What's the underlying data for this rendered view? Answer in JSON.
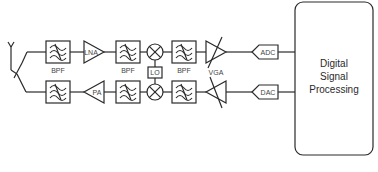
{
  "diagram": {
    "type": "rf-transceiver-block-diagram",
    "rx_chain": {
      "blocks": [
        {
          "id": "bpf1",
          "label": "BPF",
          "kind": "bandpass-filter"
        },
        {
          "id": "lna",
          "label": "LNA",
          "kind": "amplifier"
        },
        {
          "id": "bpf2",
          "label": "BPF",
          "kind": "bandpass-filter"
        },
        {
          "id": "mixer_rx",
          "label": "",
          "kind": "mixer"
        },
        {
          "id": "bpf3",
          "label": "BPF",
          "kind": "bandpass-filter"
        },
        {
          "id": "vga",
          "label": "VGA",
          "kind": "variable-gain-amplifier"
        },
        {
          "id": "adc",
          "label": "ADC",
          "kind": "converter"
        }
      ]
    },
    "tx_chain": {
      "blocks": [
        {
          "id": "bpf4",
          "label": "",
          "kind": "bandpass-filter"
        },
        {
          "id": "pa",
          "label": "PA",
          "kind": "amplifier"
        },
        {
          "id": "bpf5",
          "label": "",
          "kind": "bandpass-filter"
        },
        {
          "id": "mixer_tx",
          "label": "",
          "kind": "mixer"
        },
        {
          "id": "bpf6",
          "label": "",
          "kind": "bandpass-filter"
        },
        {
          "id": "vga_tx",
          "label": "",
          "kind": "variable-gain-amplifier"
        },
        {
          "id": "dac",
          "label": "DAC",
          "kind": "converter"
        }
      ]
    },
    "lo": {
      "label": "LO"
    },
    "dsp": {
      "lines": [
        "Digital",
        "Signal",
        "Processing"
      ]
    },
    "antenna": {
      "kind": "antenna-with-switch"
    },
    "labels": {
      "bpf": "BPF",
      "lna": "LNA",
      "pa": "PA",
      "lo": "LO",
      "vga": "VGA",
      "adc": "ADC",
      "dac": "DAC",
      "dsp1": "Digital",
      "dsp2": "Signal",
      "dsp3": "Processing"
    }
  }
}
